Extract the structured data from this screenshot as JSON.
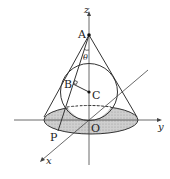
{
  "figure": {
    "colors": {
      "line": "#333333",
      "axis": "#444444",
      "shade": "#c8c8c8",
      "background": "#ffffff"
    },
    "axes": {
      "z_label": "z",
      "y_label": "y",
      "x_label": "x"
    },
    "points": {
      "A": "A",
      "B": "B",
      "C": "C",
      "O": "O",
      "P": "P"
    },
    "angle_label": "θ"
  }
}
